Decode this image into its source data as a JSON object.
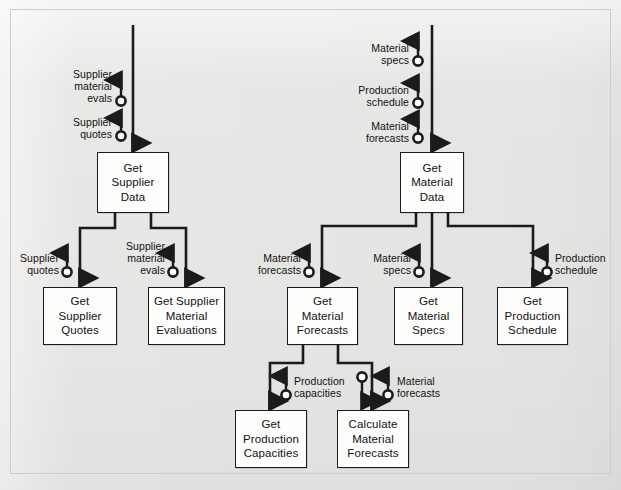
{
  "diagram": {
    "style": {
      "background": "#e8e8e6",
      "node_fill": "#fdfdfc",
      "line_color": "#1b1b1b",
      "text_color": "#121212"
    },
    "nodes": [
      {
        "id": "get-supplier-data",
        "lines": [
          "Get",
          "Supplier",
          "Data"
        ],
        "x": 97,
        "y": 152,
        "w": 72,
        "h": 61
      },
      {
        "id": "get-material-data",
        "lines": [
          "Get",
          "Material",
          "Data"
        ],
        "x": 400,
        "y": 152,
        "w": 64,
        "h": 61
      },
      {
        "id": "get-supplier-quotes",
        "lines": [
          "Get",
          "Supplier",
          "Quotes"
        ],
        "x": 43,
        "y": 287,
        "w": 74,
        "h": 58
      },
      {
        "id": "get-supplier-material-evaluations",
        "lines": [
          "Get Supplier",
          "Material",
          "Evaluations"
        ],
        "x": 148,
        "y": 287,
        "w": 77,
        "h": 58
      },
      {
        "id": "get-material-forecasts",
        "lines": [
          "Get",
          "Material",
          "Forecasts"
        ],
        "x": 287,
        "y": 287,
        "w": 71,
        "h": 58
      },
      {
        "id": "get-material-specs",
        "lines": [
          "Get",
          "Material",
          "Specs"
        ],
        "x": 394,
        "y": 287,
        "w": 69,
        "h": 58
      },
      {
        "id": "get-production-schedule",
        "lines": [
          "Get",
          "Production",
          "Schedule"
        ],
        "x": 497,
        "y": 287,
        "w": 71,
        "h": 58
      },
      {
        "id": "get-production-capacities",
        "lines": [
          "Get",
          "Production",
          "Capacities"
        ],
        "x": 235,
        "y": 410,
        "w": 72,
        "h": 58
      },
      {
        "id": "calculate-material-forecasts",
        "lines": [
          "Calculate",
          "Material",
          "Forecasts"
        ],
        "x": 337,
        "y": 410,
        "w": 72,
        "h": 58
      }
    ],
    "flow_labels": [
      {
        "id": "supplier-material-evals-top",
        "lines": [
          "Supplier",
          "material",
          "evals"
        ],
        "align": "r",
        "x": 72,
        "y": 68
      },
      {
        "id": "supplier-quotes-top",
        "lines": [
          "Supplier",
          "quotes"
        ],
        "align": "r",
        "x": 72,
        "y": 116
      },
      {
        "id": "material-specs-top",
        "lines": [
          "Material",
          "specs"
        ],
        "align": "r",
        "x": 357,
        "y": 42
      },
      {
        "id": "production-schedule-top",
        "lines": [
          "Production",
          "schedule"
        ],
        "align": "r",
        "x": 357,
        "y": 84
      },
      {
        "id": "material-forecasts-top",
        "lines": [
          "Material",
          "forecasts"
        ],
        "align": "r",
        "x": 357,
        "y": 120
      },
      {
        "id": "supplier-quotes-branch",
        "lines": [
          "Supplier",
          "quotes"
        ],
        "align": "r",
        "x": 18,
        "y": 252
      },
      {
        "id": "supplier-material-evals-branch",
        "lines": [
          "Supplier",
          "material",
          "evals"
        ],
        "align": "r",
        "x": 123,
        "y": 245
      },
      {
        "id": "material-forecasts-branch",
        "lines": [
          "Material",
          "forecasts"
        ],
        "align": "r",
        "x": 261,
        "y": 252
      },
      {
        "id": "material-specs-branch",
        "lines": [
          "Material",
          "specs"
        ],
        "align": "r",
        "x": 370,
        "y": 252
      },
      {
        "id": "production-schedule-branch",
        "lines": [
          "Production",
          "schedule"
        ],
        "align": "l",
        "x": 553,
        "y": 252
      },
      {
        "id": "production-capacities-sub",
        "lines": [
          "Production",
          "capacities"
        ],
        "align": "l",
        "x": 295,
        "y": 375
      },
      {
        "id": "material-forecasts-sub",
        "lines": [
          "Material",
          "forecasts"
        ],
        "align": "l",
        "x": 397,
        "y": 375
      }
    ],
    "edges": [
      {
        "id": "external-to-supplier-data",
        "from": "external",
        "to": "get-supplier-data"
      },
      {
        "id": "external-to-material-data",
        "from": "external",
        "to": "get-material-data"
      },
      {
        "id": "supplier-data-to-quotes",
        "from": "get-supplier-data",
        "to": "get-supplier-quotes"
      },
      {
        "id": "supplier-data-to-evals",
        "from": "get-supplier-data",
        "to": "get-supplier-material-evaluations"
      },
      {
        "id": "material-data-to-forecasts",
        "from": "get-material-data",
        "to": "get-material-forecasts"
      },
      {
        "id": "material-data-to-specs",
        "from": "get-material-data",
        "to": "get-material-specs"
      },
      {
        "id": "material-data-to-schedule",
        "from": "get-material-data",
        "to": "get-production-schedule"
      },
      {
        "id": "forecasts-to-capacities",
        "from": "get-material-forecasts",
        "to": "get-production-capacities"
      },
      {
        "id": "forecasts-to-calculate",
        "from": "get-material-forecasts",
        "to": "calculate-material-forecasts"
      }
    ]
  }
}
